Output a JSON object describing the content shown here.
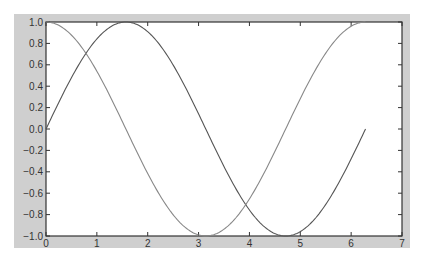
{
  "chart_data": {
    "type": "line",
    "title": "",
    "xlabel": "",
    "ylabel": "",
    "xlim": [
      0,
      7
    ],
    "ylim": [
      -1,
      1
    ],
    "grid": false,
    "legend": null,
    "x_ticks": [
      "0",
      "1",
      "2",
      "3",
      "4",
      "5",
      "6",
      "7"
    ],
    "y_ticks": [
      "1.0",
      "0.8",
      "0.6",
      "0.4",
      "0.2",
      "0.0",
      "-0.2",
      "-0.4",
      "-0.6",
      "-0.8",
      "-1.0"
    ],
    "x": [
      0,
      0.3142,
      0.6283,
      0.9425,
      1.2566,
      1.5708,
      1.885,
      2.1991,
      2.5133,
      2.8274,
      3.1416,
      3.4558,
      3.7699,
      4.0841,
      4.3982,
      4.7124,
      5.0265,
      5.3407,
      5.6549,
      5.969,
      6.2832
    ],
    "series": [
      {
        "name": "sin(x)",
        "color": "#555555",
        "values": [
          0,
          0.309,
          0.588,
          0.809,
          0.951,
          1.0,
          0.951,
          0.809,
          0.588,
          0.309,
          0,
          -0.309,
          -0.588,
          -0.809,
          -0.951,
          -1.0,
          -0.951,
          -0.809,
          -0.588,
          -0.309,
          0
        ]
      },
      {
        "name": "cos(x)",
        "color": "#888888",
        "values": [
          1.0,
          0.951,
          0.809,
          0.588,
          0.309,
          0,
          -0.309,
          -0.588,
          -0.809,
          -0.951,
          -1.0,
          -0.951,
          -0.809,
          -0.588,
          -0.309,
          0,
          0.309,
          0.588,
          0.809,
          0.951,
          1.0
        ]
      }
    ]
  },
  "style": {
    "frame_color": "#d0d0d0",
    "axes_bg": "#ffffff",
    "axes_edge": "#333333"
  }
}
